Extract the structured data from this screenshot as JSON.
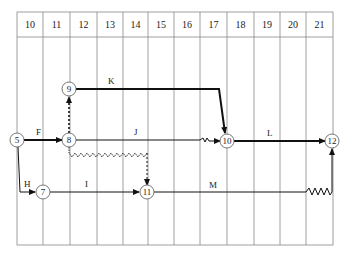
{
  "diagram": {
    "type": "time-scaled network (arrow diagram)",
    "time_axis": {
      "labels": [
        "10",
        "11",
        "12",
        "13",
        "14",
        "15",
        "16",
        "17",
        "18",
        "19",
        "20",
        "21"
      ]
    },
    "nodes": [
      {
        "id": "5",
        "label": "5"
      },
      {
        "id": "7",
        "label": "7"
      },
      {
        "id": "8",
        "label": "8"
      },
      {
        "id": "9",
        "label": "9"
      },
      {
        "id": "10",
        "label": "10"
      },
      {
        "id": "11",
        "label": "11"
      },
      {
        "id": "12",
        "label": "12"
      }
    ],
    "activities": [
      {
        "label": "F",
        "from": "5",
        "to": "8",
        "style": "critical"
      },
      {
        "label": "H",
        "from": "5",
        "to": "7",
        "style": "normal"
      },
      {
        "label": "I",
        "from": "7",
        "to": "11",
        "style": "normal"
      },
      {
        "label": "J",
        "from": "8",
        "to": "10",
        "style": "normal, float shown as wavy line"
      },
      {
        "label": "K",
        "from": "9",
        "to": "10",
        "style": "critical"
      },
      {
        "label": "L",
        "from": "10",
        "to": "12",
        "style": "critical"
      },
      {
        "label": "M",
        "from": "11",
        "to": "12",
        "style": "normal, float shown as wavy line"
      }
    ],
    "dummies": [
      {
        "from": "8",
        "to": "9",
        "style": "dashed, critical"
      },
      {
        "from": "8",
        "to": "11",
        "style": "dashed with wavy float"
      }
    ]
  }
}
